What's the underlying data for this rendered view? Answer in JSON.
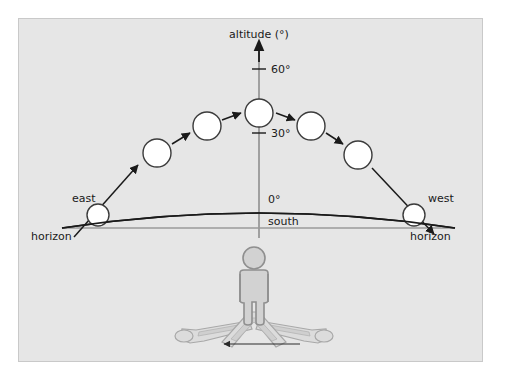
{
  "diagram": {
    "background_color": "#e6e6e6",
    "border_color": "#c9c9c9",
    "axis": {
      "label": "altitude (°)",
      "axis_color": "#8c8c8c",
      "arrow_color": "#1a1a1a",
      "ticks": [
        {
          "label": "60°",
          "y_px": 69
        },
        {
          "label": "30°",
          "y_px": 133
        },
        {
          "label": "0°",
          "y_px": 199
        }
      ]
    },
    "horizon": {
      "left_label": "horizon",
      "right_label": "horizon",
      "center_label": "south",
      "east_label": "east",
      "west_label": "west",
      "curve_color": "#1a1a1a",
      "line_color": "#9a9a9a"
    },
    "sun": {
      "fill": "#ffffff",
      "stroke": "#3b3b3b",
      "positions": [
        {
          "name": "sunrise-east",
          "cx": 98,
          "cy": 215,
          "r": 11
        },
        {
          "name": "morning-low",
          "cx": 157,
          "cy": 153,
          "r": 14
        },
        {
          "name": "morning-high",
          "cx": 207,
          "cy": 126,
          "r": 14
        },
        {
          "name": "noon-south",
          "cx": 259,
          "cy": 113,
          "r": 14
        },
        {
          "name": "afternoon-high",
          "cx": 311,
          "cy": 126,
          "r": 14
        },
        {
          "name": "afternoon-low",
          "cx": 358,
          "cy": 155,
          "r": 14
        },
        {
          "name": "sunset-west",
          "cx": 414,
          "cy": 215,
          "r": 11
        }
      ],
      "arrow_color": "#1a1a1a"
    },
    "observer": {
      "name": "person-figure",
      "stroke": "#8f8f8f",
      "fill": "#d2d2d2",
      "head_cx": 254,
      "head_cy": 258,
      "head_r": 11
    },
    "shadows": {
      "stroke": "#a8a8a8",
      "fill": "#dcdcdc",
      "direction_arrow_label": "shadow sweep direction",
      "arrow_color": "#2a2a2a"
    }
  }
}
